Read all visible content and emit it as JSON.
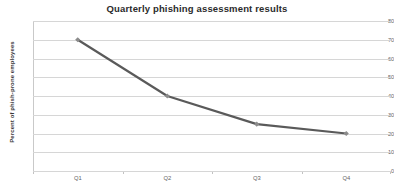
{
  "chart_data": {
    "type": "line",
    "title": "Quarterly phishing  assessment  results",
    "xlabel": "",
    "ylabel": "Percent of phish-prone employees",
    "categories": [
      "Q1",
      "Q2",
      "Q3",
      "Q4"
    ],
    "values": [
      70,
      40,
      25,
      20
    ],
    "series": [
      {
        "name": "Percent of phish-prone employees",
        "values": [
          70,
          40,
          25,
          20
        ]
      }
    ],
    "ylim": [
      0,
      80
    ],
    "y_ticks": [
      0,
      10,
      20,
      30,
      40,
      50,
      60,
      70,
      80
    ],
    "y_tick_labels": [
      "0",
      "10",
      "20",
      "30",
      "40",
      "50",
      "60",
      "70",
      "80"
    ],
    "grid": true,
    "grid_axis": "y",
    "legend": false,
    "legend_position": "none",
    "line_color": "#5a5a5a",
    "marker_color": "#8c8c8c",
    "marker_shape": "diamond",
    "gridline_color": "#d6d6d6",
    "title_color": "#2b2b2b",
    "tick_label_color": "#636363",
    "background_color": "#ffffff"
  }
}
